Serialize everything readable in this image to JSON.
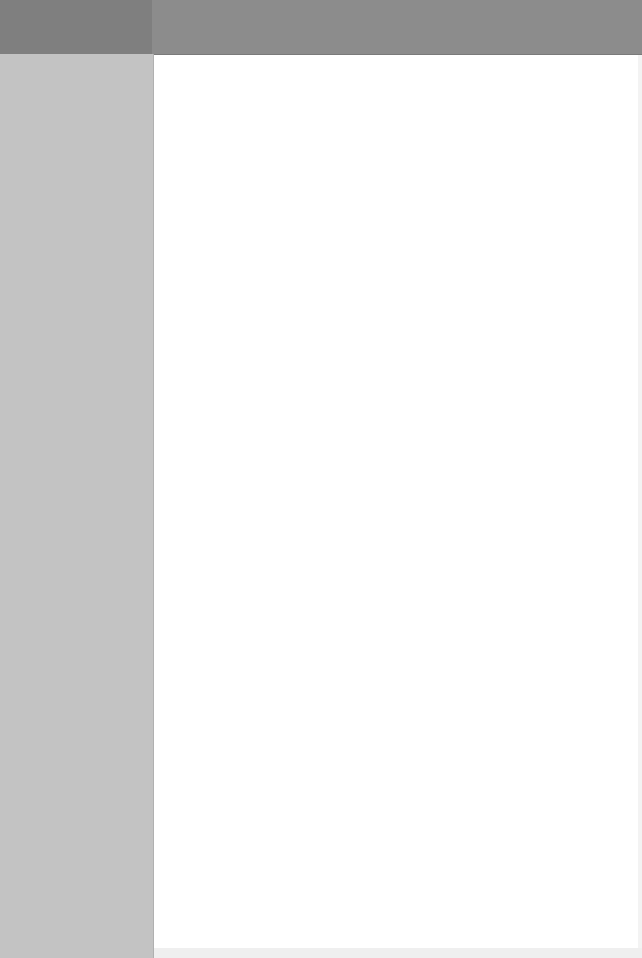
{
  "header": {
    "left_color": "#7f7f7f",
    "right_color": "#8c8c8c"
  },
  "sidebar": {
    "color": "#c3c3c3",
    "items": []
  },
  "main": {
    "color": "#ffffff",
    "content": []
  }
}
